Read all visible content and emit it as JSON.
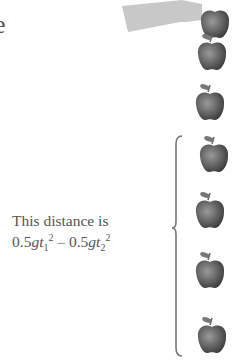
{
  "figure": {
    "cut_letter": "e",
    "caption": {
      "line1": "This distance is",
      "formula": {
        "term1_coef": "0.5",
        "term1_var": "gt",
        "term1_sub": "1",
        "term1_sup": "2",
        "operator": "–",
        "term2_coef": "0.5",
        "term2_var": "gt",
        "term2_sub": "2",
        "term2_sup": "2"
      }
    },
    "apples": [
      {
        "label": "apple-0",
        "x": 198,
        "y": 0,
        "held": true
      },
      {
        "label": "apple-1",
        "x": 195,
        "y": 32
      },
      {
        "label": "apple-2",
        "x": 193,
        "y": 82
      },
      {
        "label": "apple-3",
        "x": 197,
        "y": 134
      },
      {
        "label": "apple-4",
        "x": 193,
        "y": 190
      },
      {
        "label": "apple-5",
        "x": 193,
        "y": 250
      },
      {
        "label": "apple-6",
        "x": 195,
        "y": 315
      }
    ],
    "colors": {
      "apple": "#5a5a5a",
      "hand": "#c8c8c8",
      "text": "#555555",
      "brace": "#777777"
    }
  }
}
